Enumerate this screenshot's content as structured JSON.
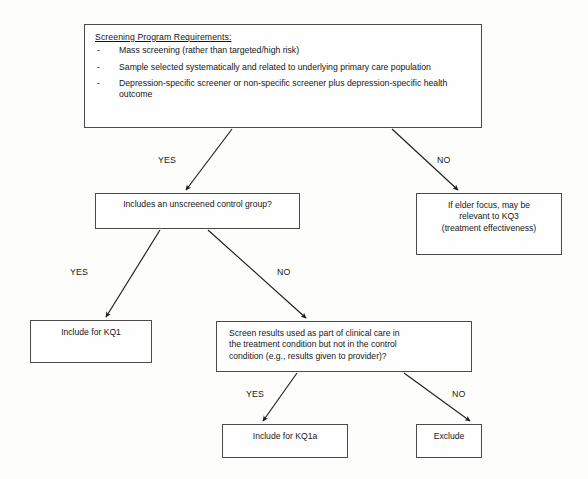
{
  "diagram": {
    "nodes": {
      "requirements": {
        "heading": "Screening Program Requirements:",
        "bullet_marker": "-",
        "items": [
          "Mass screening (rather than targeted/high risk)",
          "Sample selected systematically and related to underlying primary care population",
          "Depression-specific screener or non-specific screener plus depression-specific health outcome"
        ]
      },
      "control_group": {
        "text": "Includes an unscreened control group?"
      },
      "elder_focus": {
        "line1": "If elder focus, may be",
        "line2": "relevant to KQ3",
        "line3": "(treatment effectiveness)"
      },
      "include_kq1": {
        "text": "Include for KQ1"
      },
      "screen_results": {
        "line1": "Screen results used as part of clinical care in",
        "line2": "the treatment condition but not in the control",
        "line3": "condition  (e.g., results given to provider)?"
      },
      "include_kq1a": {
        "text": "Include for KQ1a"
      },
      "exclude": {
        "text": "Exclude"
      }
    },
    "edge_labels": {
      "yes_1": "YES",
      "no_1": "NO",
      "yes_2": "YES",
      "no_2": "NO",
      "yes_3": "YES",
      "no_3": "NO"
    },
    "colors": {
      "border": "#4a4a4a",
      "text": "#161616",
      "background": "#fdfdfc",
      "arrow": "#1d1d1d"
    }
  }
}
